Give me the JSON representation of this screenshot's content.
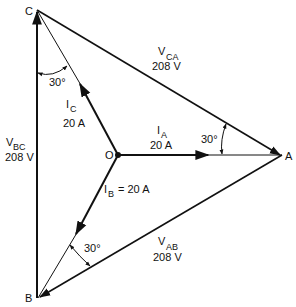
{
  "diagram": {
    "type": "three-phase phasor diagram",
    "points": {
      "A": {
        "label": "A"
      },
      "B": {
        "label": "B"
      },
      "C": {
        "label": "C"
      },
      "O": {
        "label": "O"
      }
    },
    "voltages": {
      "ca": {
        "main": "V",
        "sub": "CA",
        "value": "208 V"
      },
      "bc": {
        "main": "V",
        "sub": "BC",
        "value": "208 V"
      },
      "ab": {
        "main": "V",
        "sub": "AB",
        "value": "208 V"
      }
    },
    "currents": {
      "a": {
        "main": "I",
        "sub": "A",
        "value": "20 A"
      },
      "b": {
        "main": "I",
        "sub": "B",
        "value": "= 20 A"
      },
      "c": {
        "main": "I",
        "sub": "C",
        "value": "20 A"
      }
    },
    "angles": {
      "at_c": "30°",
      "at_a": "30°",
      "at_b": "30°"
    },
    "colors": {
      "stroke": "#111111",
      "background": "#ffffff"
    }
  }
}
